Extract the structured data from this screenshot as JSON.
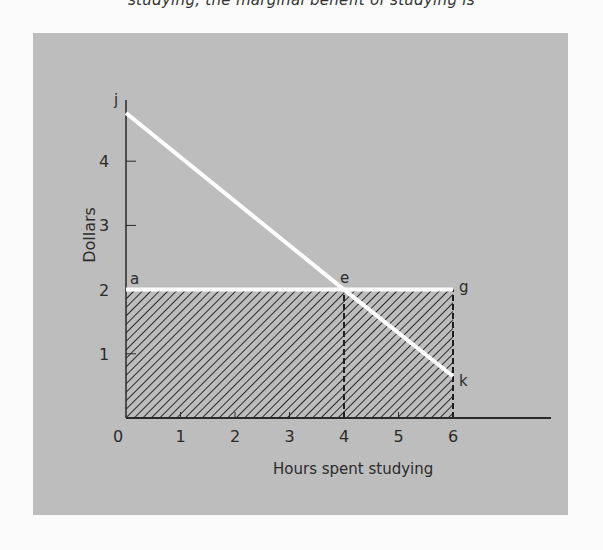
{
  "page": {
    "top_text": "studying, the marginal benefit of studying is"
  },
  "chart_data": {
    "type": "line",
    "title": "",
    "xlabel": "Hours spent studying",
    "ylabel": "Dollars",
    "x_ticks": [
      "0",
      "1",
      "2",
      "3",
      "4",
      "5",
      "6"
    ],
    "y_ticks": [
      "1",
      "2",
      "3",
      "4"
    ],
    "xlim": [
      0,
      7.8
    ],
    "ylim": [
      0,
      5
    ],
    "grid": false,
    "series": [
      {
        "name": "Marginal benefit line jk",
        "color": "#ffffff",
        "points": [
          {
            "x": 0,
            "y": 4.75
          },
          {
            "x": 4,
            "y": 2.0
          },
          {
            "x": 6,
            "y": 0.65
          }
        ]
      },
      {
        "name": "Horizontal line aeg (price $2)",
        "color": "#ffffff",
        "points": [
          {
            "x": 0,
            "y": 2
          },
          {
            "x": 4,
            "y": 2
          },
          {
            "x": 6,
            "y": 2
          }
        ]
      }
    ],
    "shaded_region": {
      "x0": 0,
      "x1": 6,
      "y0": 0,
      "y1": 2,
      "pattern": "diagonal-hatch"
    },
    "dashed_verticals": [
      4,
      6
    ],
    "point_labels": [
      {
        "label": "j",
        "x": 0,
        "y": 4.75
      },
      {
        "label": "a",
        "x": 0,
        "y": 2
      },
      {
        "label": "e",
        "x": 4,
        "y": 2
      },
      {
        "label": "g",
        "x": 6,
        "y": 2
      },
      {
        "label": "k",
        "x": 6,
        "y": 0.65
      }
    ]
  }
}
